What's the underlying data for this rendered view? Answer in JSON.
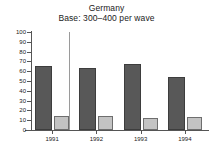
{
  "chart_data": {
    "type": "bar",
    "title": "Germany",
    "subtitle": "Base: 300–400 per wave",
    "xlabel": "",
    "ylabel": "",
    "categories": [
      "1991",
      "1992",
      "1993",
      "1994"
    ],
    "series": [
      {
        "name": "series-1-dark",
        "values": [
          65,
          63,
          67,
          54
        ],
        "color": "#585858"
      },
      {
        "name": "series-2-light",
        "values": [
          14,
          14,
          12,
          13
        ],
        "color": "#c3c3c3"
      }
    ],
    "ylim": [
      0,
      100
    ],
    "yticks": [
      100,
      90,
      80,
      70,
      60,
      50,
      40,
      30,
      20,
      10,
      0
    ],
    "grid": false,
    "legend": "none",
    "annotations": [
      {
        "name": "vertical-separator",
        "after_category": "1991"
      }
    ]
  }
}
